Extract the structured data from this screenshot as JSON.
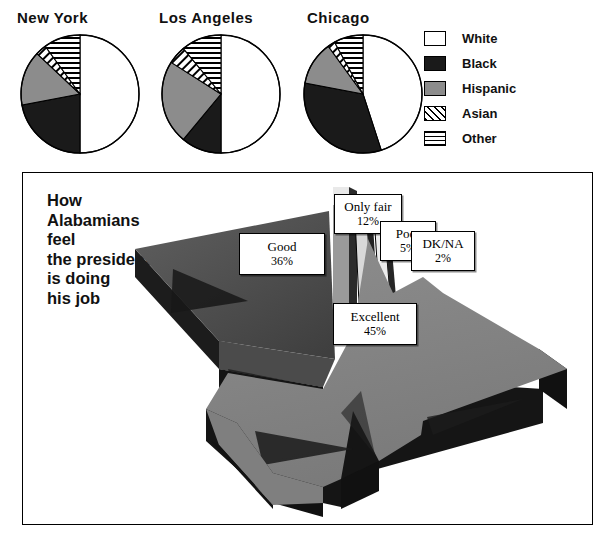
{
  "top": {
    "pies": [
      {
        "title": "New York",
        "segments": [
          {
            "label": "White",
            "value": 50,
            "pattern": "white"
          },
          {
            "label": "Black",
            "value": 22,
            "pattern": "black"
          },
          {
            "label": "Hispanic",
            "value": 15,
            "pattern": "hispanic"
          },
          {
            "label": "Asian",
            "value": 3,
            "pattern": "asian"
          },
          {
            "label": "Other",
            "value": 10,
            "pattern": "other"
          }
        ]
      },
      {
        "title": "Los Angeles",
        "segments": [
          {
            "label": "White",
            "value": 50,
            "pattern": "white"
          },
          {
            "label": "Black",
            "value": 11,
            "pattern": "black"
          },
          {
            "label": "Hispanic",
            "value": 23,
            "pattern": "hispanic"
          },
          {
            "label": "Asian",
            "value": 5,
            "pattern": "asian"
          },
          {
            "label": "Other",
            "value": 11,
            "pattern": "other"
          }
        ]
      },
      {
        "title": "Chicago",
        "segments": [
          {
            "label": "White",
            "value": 45,
            "pattern": "white"
          },
          {
            "label": "Black",
            "value": 33,
            "pattern": "black"
          },
          {
            "label": "Hispanic",
            "value": 12,
            "pattern": "hispanic"
          },
          {
            "label": "Asian",
            "value": 2,
            "pattern": "asian"
          },
          {
            "label": "Other",
            "value": 8,
            "pattern": "other"
          }
        ]
      }
    ]
  },
  "legend": {
    "items": [
      {
        "label": "White",
        "pattern": "white"
      },
      {
        "label": "Black",
        "pattern": "black"
      },
      {
        "label": "Hispanic",
        "pattern": "hispanic"
      },
      {
        "label": "Asian",
        "pattern": "asian"
      },
      {
        "label": "Other",
        "pattern": "other"
      }
    ]
  },
  "panel": {
    "title": "How\nAlabamians\nfeel\nthe president\nis doing\nhis job",
    "callouts": [
      {
        "name": "Good",
        "value": "36%"
      },
      {
        "name": "Only fair",
        "value": "12%"
      },
      {
        "name": "Poor",
        "value": "5%"
      },
      {
        "name": "DK/NA",
        "value": "2%"
      },
      {
        "name": "Excellent",
        "value": "45%"
      }
    ]
  },
  "colors": {
    "black": "#1a1a1a",
    "hispanic": "#8c8c8c",
    "slice_top_light": "#8a8a8a",
    "slice_top_dark": "#4d4d4d",
    "slice_side": "#1f1f1f",
    "outline": "#000000"
  },
  "chart_data": [
    {
      "type": "pie",
      "title": "New York",
      "categories": [
        "White",
        "Black",
        "Hispanic",
        "Asian",
        "Other"
      ],
      "values": [
        50,
        22,
        15,
        3,
        10
      ],
      "legend_position": "right"
    },
    {
      "type": "pie",
      "title": "Los Angeles",
      "categories": [
        "White",
        "Black",
        "Hispanic",
        "Asian",
        "Other"
      ],
      "values": [
        50,
        11,
        23,
        5,
        11
      ],
      "legend_position": "right"
    },
    {
      "type": "pie",
      "title": "Chicago",
      "categories": [
        "White",
        "Black",
        "Hispanic",
        "Asian",
        "Other"
      ],
      "values": [
        45,
        33,
        12,
        2,
        8
      ],
      "legend_position": "right"
    },
    {
      "type": "pie",
      "title": "How Alabamians feel the president is doing his job",
      "categories": [
        "Excellent",
        "Good",
        "Only fair",
        "Poor",
        "DK/NA"
      ],
      "values": [
        45,
        36,
        12,
        5,
        2
      ],
      "exploded": true,
      "three_d": true,
      "legend_position": "none"
    }
  ]
}
